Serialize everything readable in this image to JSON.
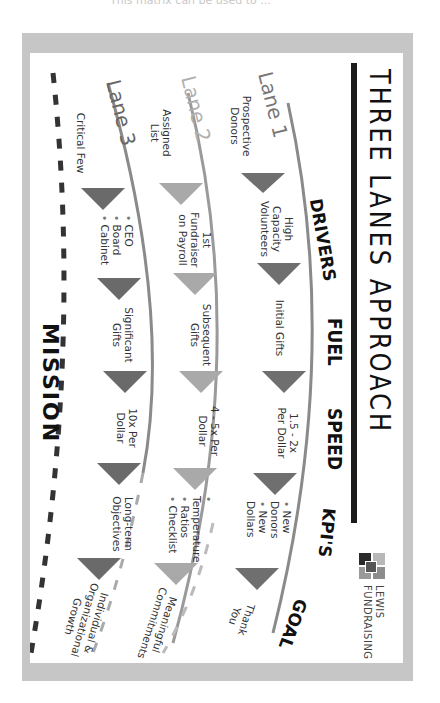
{
  "page": {
    "cut_text": "This matrix can be used to ..."
  },
  "infographic": {
    "title": "THREE LANES APPROACH",
    "logo": {
      "line1": "LEWIS",
      "line2": "FUNDRAISING"
    },
    "columns": [
      "DRIVERS",
      "FUEL",
      "SPEED",
      "KPI'S",
      "GOAL"
    ],
    "footer": "MISSION",
    "lanes": [
      {
        "name": "Lane 1",
        "color": "#6f6f6f",
        "source": "Prospective Donors",
        "drivers": "High Capacity Volunteers",
        "fuel": "Initial Gifts",
        "speed": "1.5 - 2x Per Dollar",
        "kpis": [
          "New Donors",
          "New Dollars"
        ],
        "goal": "Thank You"
      },
      {
        "name": "Lane 2",
        "color": "#a9a9a9",
        "source": "Assigned List",
        "drivers": "1st Fundraiser on Payroll",
        "fuel": "Subsequent Gifts",
        "speed": "4 - 5x Per Dollar",
        "kpis": [
          "Temperature",
          "Ratios",
          "Checklist"
        ],
        "goal": "Meaningful Commitments"
      },
      {
        "name": "Lane 3",
        "color": "#5a5a5a",
        "source": "Critical Few",
        "drivers": [
          "CEO",
          "Board",
          "Cabinet"
        ],
        "fuel": "Significant Gifts",
        "speed": "10x Per Dollar",
        "kpis": "Long-term Objectives",
        "goal": "Individual & Organizational Growth"
      }
    ],
    "colors": {
      "frame": "#c6c6c6",
      "title_bar": "#1c1c1c",
      "lane1_arrow": "#6f6f6f",
      "lane2_arrow": "#a9a9a9",
      "lane3_arrow": "#6a6a6a"
    }
  }
}
